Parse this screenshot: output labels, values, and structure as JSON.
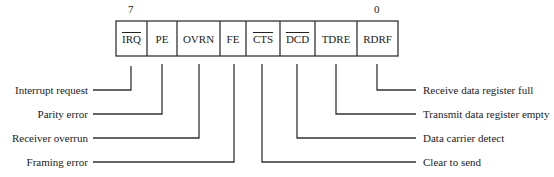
{
  "diagram": {
    "bit_numbers": {
      "msb": "7",
      "lsb": "0"
    },
    "bits": [
      {
        "name": "IRQ",
        "overline": true,
        "description": "Interrupt request"
      },
      {
        "name": "PE",
        "overline": false,
        "description": "Parity error"
      },
      {
        "name": "OVRN",
        "overline": false,
        "description": "Receiver overrun"
      },
      {
        "name": "FE",
        "overline": false,
        "description": "Framing error"
      },
      {
        "name": "CTS",
        "overline": true,
        "description": "Clear to send"
      },
      {
        "name": "DCD",
        "overline": true,
        "description": "Data carrier detect"
      },
      {
        "name": "TDRE",
        "overline": false,
        "description": "Transmit data register empty"
      },
      {
        "name": "RDRF",
        "overline": false,
        "description": "Receive data register full"
      }
    ]
  }
}
